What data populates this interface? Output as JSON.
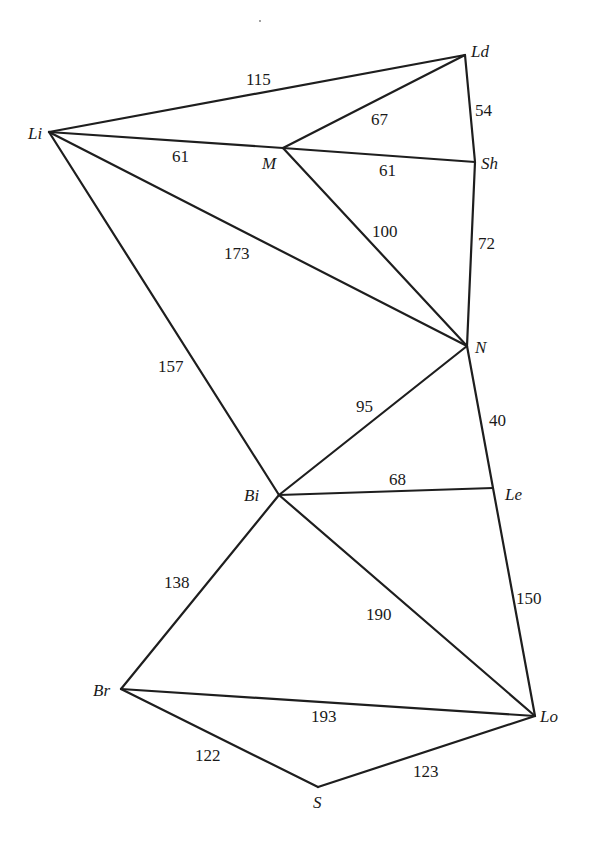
{
  "diagram": {
    "type": "weighted-undirected-graph",
    "nodes": [
      {
        "id": "Ld",
        "label": "Ld",
        "x": 465,
        "y": 55,
        "lx": 471,
        "ly": 57
      },
      {
        "id": "Li",
        "label": "Li",
        "x": 49,
        "y": 132,
        "lx": 28,
        "ly": 139
      },
      {
        "id": "M",
        "label": "M",
        "x": 283,
        "y": 148,
        "lx": 262,
        "ly": 169
      },
      {
        "id": "Sh",
        "label": "Sh",
        "x": 475,
        "y": 162,
        "lx": 481,
        "ly": 169
      },
      {
        "id": "N",
        "label": "N",
        "x": 467,
        "y": 346,
        "lx": 475,
        "ly": 353
      },
      {
        "id": "Bi",
        "label": "Bi",
        "x": 279,
        "y": 495,
        "lx": 244,
        "ly": 501
      },
      {
        "id": "Le",
        "label": "Le",
        "x": 493,
        "y": 488,
        "lx": 505,
        "ly": 500
      },
      {
        "id": "Br",
        "label": "Br",
        "x": 121,
        "y": 689,
        "lx": 93,
        "ly": 696
      },
      {
        "id": "Lo",
        "label": "Lo",
        "x": 535,
        "y": 716,
        "lx": 540,
        "ly": 722
      },
      {
        "id": "S",
        "label": "S",
        "x": 318,
        "y": 787,
        "lx": 313,
        "ly": 808
      }
    ],
    "edges": [
      {
        "from": "Li",
        "to": "Ld",
        "weight": "115",
        "wx": 246,
        "wy": 85
      },
      {
        "from": "M",
        "to": "Ld",
        "weight": "67",
        "wx": 371,
        "wy": 125
      },
      {
        "from": "Ld",
        "to": "Sh",
        "weight": "54",
        "wx": 475,
        "wy": 116
      },
      {
        "from": "Li",
        "to": "M",
        "weight": "61",
        "wx": 172,
        "wy": 162
      },
      {
        "from": "M",
        "to": "Sh",
        "weight": "61",
        "wx": 379,
        "wy": 176
      },
      {
        "from": "M",
        "to": "N",
        "weight": "100",
        "wx": 372,
        "wy": 237
      },
      {
        "from": "Sh",
        "to": "N",
        "weight": "72",
        "wx": 478,
        "wy": 249
      },
      {
        "from": "Li",
        "to": "N",
        "weight": "173",
        "wx": 224,
        "wy": 259
      },
      {
        "from": "Li",
        "to": "Bi",
        "weight": "157",
        "wx": 158,
        "wy": 372
      },
      {
        "from": "N",
        "to": "Bi",
        "weight": "95",
        "wx": 356,
        "wy": 412
      },
      {
        "from": "N",
        "to": "Le",
        "weight": "40",
        "wx": 489,
        "wy": 426
      },
      {
        "from": "Bi",
        "to": "Le",
        "weight": "68",
        "wx": 389,
        "wy": 485
      },
      {
        "from": "Bi",
        "to": "Br",
        "weight": "138",
        "wx": 164,
        "wy": 588
      },
      {
        "from": "Bi",
        "to": "Lo",
        "weight": "190",
        "wx": 366,
        "wy": 620
      },
      {
        "from": "Le",
        "to": "Lo",
        "weight": "150",
        "wx": 516,
        "wy": 604
      },
      {
        "from": "Br",
        "to": "Lo",
        "weight": "193",
        "wx": 311,
        "wy": 722
      },
      {
        "from": "Br",
        "to": "S",
        "weight": "122",
        "wx": 195,
        "wy": 761
      },
      {
        "from": "S",
        "to": "Lo",
        "weight": "123",
        "wx": 413,
        "wy": 777
      }
    ]
  }
}
